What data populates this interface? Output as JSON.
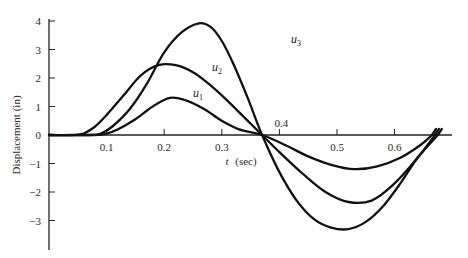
{
  "chart_data": {
    "type": "line",
    "title": "",
    "xlabel": "t (sec)",
    "ylabel": "Displacement (in)",
    "xlim": [
      0,
      0.69
    ],
    "ylim": [
      -4,
      4
    ],
    "x_ticks": [
      "0.1",
      "0.2",
      "0.3",
      "0.4",
      "0.5",
      "0.6"
    ],
    "y_ticks": [
      "4",
      "3",
      "2",
      "1",
      "0",
      "-1",
      "-2",
      "-3"
    ],
    "grid": false,
    "legend": "inline labels near curves",
    "series": [
      {
        "name": "u1",
        "x": [
          0,
          0.08,
          0.1,
          0.12,
          0.15,
          0.18,
          0.21,
          0.24,
          0.27,
          0.3,
          0.33,
          0.37,
          0.41,
          0.45,
          0.49,
          0.53,
          0.57,
          0.61,
          0.645,
          0.665
        ],
        "y": [
          0,
          0,
          0.05,
          0.2,
          0.55,
          1.0,
          1.3,
          1.2,
          0.9,
          0.5,
          0.2,
          0,
          -0.35,
          -0.75,
          -1.05,
          -1.2,
          -1.1,
          -0.8,
          -0.35,
          0
        ]
      },
      {
        "name": "u2",
        "x": [
          0,
          0.04,
          0.06,
          0.08,
          0.1,
          0.13,
          0.16,
          0.19,
          0.22,
          0.25,
          0.28,
          0.31,
          0.34,
          0.37,
          0.4,
          0.44,
          0.48,
          0.52,
          0.56,
          0.6,
          0.64,
          0.67
        ],
        "y": [
          0,
          0,
          0.05,
          0.3,
          0.7,
          1.4,
          2.1,
          2.45,
          2.45,
          2.2,
          1.75,
          1.2,
          0.6,
          0,
          -0.6,
          -1.35,
          -2.0,
          -2.35,
          -2.3,
          -1.7,
          -0.8,
          0
        ]
      },
      {
        "name": "u3",
        "x": [
          0,
          0.07,
          0.09,
          0.11,
          0.14,
          0.17,
          0.2,
          0.23,
          0.26,
          0.28,
          0.3,
          0.32,
          0.345,
          0.37,
          0.4,
          0.43,
          0.46,
          0.49,
          0.52,
          0.55,
          0.58,
          0.61,
          0.64,
          0.675
        ],
        "y": [
          0,
          0,
          0.05,
          0.3,
          0.9,
          1.8,
          2.9,
          3.6,
          3.92,
          3.8,
          3.3,
          2.5,
          1.3,
          0,
          -1.3,
          -2.3,
          -2.95,
          -3.25,
          -3.3,
          -3.05,
          -2.5,
          -1.7,
          -0.8,
          0
        ]
      }
    ],
    "annotations": [
      {
        "text": "u3",
        "x": 0.32,
        "y": 3.3
      },
      {
        "text": "u2",
        "x": 0.285,
        "y": 2.35
      },
      {
        "text": "u1",
        "x": 0.27,
        "y": 1.3
      }
    ]
  },
  "labels": {
    "xlabel_t": "t",
    "xlabel_unit": "(sec)",
    "ylabel": "Displacement (in)",
    "u1_base": "u",
    "u1_sub": "1",
    "u2_base": "u",
    "u2_sub": "2",
    "u3_base": "u",
    "u3_sub": "3"
  }
}
